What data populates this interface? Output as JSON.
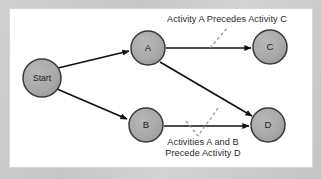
{
  "diagram": {
    "frame": {
      "outer_background_color": "#c9c9c9",
      "panel_background_color": "#ffffff",
      "panel_border_color": "#d8d8d8"
    },
    "style": {
      "node_fill_color": "#a9a9a9",
      "node_stroke_color": "#3a3a3a",
      "edge_color": "#111111",
      "leader_color": "#8a8a8a",
      "text_color": "#2b2b2b"
    },
    "nodes": [
      {
        "id": "start",
        "label": "Start",
        "cx": 42,
        "cy": 78,
        "r": 19,
        "label_size": "small"
      },
      {
        "id": "a",
        "label": "A",
        "cx": 148,
        "cy": 48,
        "r": 17,
        "label_size": "normal"
      },
      {
        "id": "b",
        "label": "B",
        "cx": 146,
        "cy": 125,
        "r": 17,
        "label_size": "normal"
      },
      {
        "id": "c",
        "label": "C",
        "cx": 270,
        "cy": 47,
        "r": 17,
        "label_size": "normal"
      },
      {
        "id": "d",
        "label": "D",
        "cx": 268,
        "cy": 125,
        "r": 17,
        "label_size": "normal"
      }
    ],
    "edges": [
      {
        "id": "start-a",
        "from": "start",
        "to": "a",
        "x1": 58,
        "y1": 68,
        "x2": 129,
        "y2": 51
      },
      {
        "id": "start-b",
        "from": "start",
        "to": "b",
        "x1": 57,
        "y1": 89,
        "x2": 127,
        "y2": 119
      },
      {
        "id": "a-c",
        "from": "a",
        "to": "c",
        "x1": 166,
        "y1": 48,
        "x2": 251,
        "y2": 48
      },
      {
        "id": "a-d",
        "from": "a",
        "to": "d",
        "x1": 160,
        "y1": 62,
        "x2": 252,
        "y2": 116
      },
      {
        "id": "b-d",
        "from": "b",
        "to": "d",
        "x1": 164,
        "y1": 126,
        "x2": 249,
        "y2": 126
      }
    ],
    "annotations": [
      {
        "id": "anno-top",
        "text": "Activity A Precedes Activity C",
        "leaders": [
          {
            "x1": 210,
            "y1": 48,
            "x2": 228,
            "y2": 27
          }
        ]
      },
      {
        "id": "anno-bottom",
        "line1": "Activities A and B",
        "line2": "Precede Activity D",
        "leaders": [
          {
            "x1": 186,
            "y1": 121,
            "x2": 198,
            "y2": 136
          },
          {
            "x1": 218,
            "y1": 108,
            "x2": 198,
            "y2": 136
          }
        ]
      }
    ]
  }
}
